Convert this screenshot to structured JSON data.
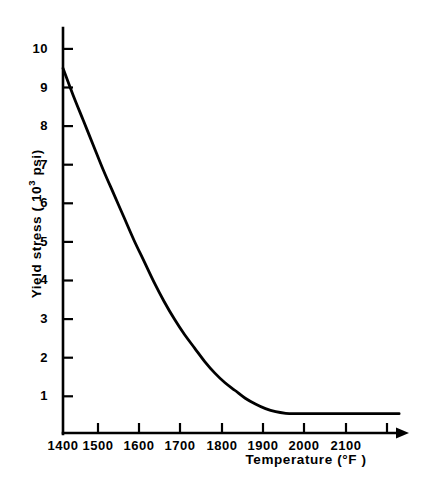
{
  "chart_data": {
    "type": "line",
    "title": "",
    "xlabel": "Temperature (°F )",
    "ylabel_prefix": "Yield stress (  10",
    "ylabel_exponent": "3",
    "ylabel_suffix": " psi)",
    "ylabel_full": "Yield stress (  10³ psi)",
    "xlim": [
      1400,
      2230
    ],
    "ylim": [
      0,
      10.4
    ],
    "grid": false,
    "legend": null,
    "xticks": [
      1400,
      1500,
      1600,
      1700,
      1800,
      1900,
      2000,
      2100,
      2200
    ],
    "xtick_labels": [
      "1400",
      "1500",
      "1600",
      "1700",
      "1800",
      "1900",
      "2000",
      "2100",
      ""
    ],
    "yticks": [
      1,
      2,
      3,
      4,
      5,
      6,
      7,
      8,
      9,
      10
    ],
    "ytick_labels": [
      "1",
      "2",
      "3",
      "4",
      "5",
      "6",
      "7",
      "8",
      "9",
      "10"
    ],
    "x_axis_arrow": true,
    "series": [
      {
        "name": "Yield stress vs temperature",
        "color": "#000000",
        "x": [
          1400,
          1425,
          1450,
          1475,
          1500,
          1525,
          1550,
          1575,
          1600,
          1625,
          1650,
          1675,
          1700,
          1725,
          1750,
          1775,
          1800,
          1825,
          1850,
          1875,
          1900,
          1925,
          1950,
          1975,
          2000,
          2050,
          2100,
          2150,
          2200,
          2230
        ],
        "y": [
          9.5,
          8.8,
          8.15,
          7.5,
          6.85,
          6.25,
          5.65,
          5.05,
          4.5,
          3.95,
          3.45,
          3.0,
          2.6,
          2.25,
          1.9,
          1.6,
          1.35,
          1.15,
          0.95,
          0.8,
          0.68,
          0.6,
          0.56,
          0.55,
          0.55,
          0.55,
          0.55,
          0.55,
          0.55,
          0.55
        ]
      }
    ],
    "annotations": []
  }
}
